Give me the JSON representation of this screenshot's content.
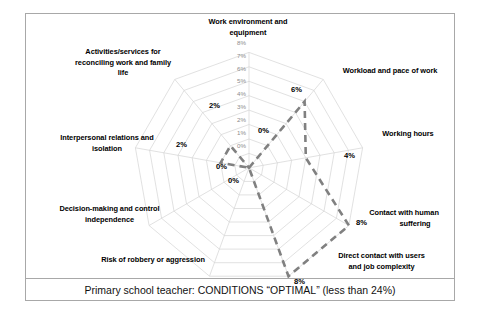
{
  "caption": {
    "text": "Primary school teacher: CONDITIONS “OPTIMAL” (less than 24%)"
  },
  "chart_data": {
    "type": "radar",
    "title": "",
    "subtitle": "",
    "xlabel": "",
    "ylabel": "",
    "grid": true,
    "legend": "none",
    "rlim": [
      0,
      8
    ],
    "rticks": [
      "0%",
      "1%",
      "2%",
      "3%",
      "4%",
      "5%",
      "6%",
      "7%",
      "8%"
    ],
    "rtick_values": [
      0,
      1,
      2,
      3,
      4,
      5,
      6,
      7,
      8
    ],
    "categories": [
      "Work environment and equipment",
      "Workload and pace of work",
      "Working hours",
      "Contact with human suffering",
      "Direct contact with users and job complexity",
      "Risk of robbery or aggression",
      "Decision-making and control independence",
      "Interpersonal relations and isolation",
      "Activities/services for reconciling work and family life"
    ],
    "series": [
      {
        "name": "Primary school teacher",
        "values": [
          0,
          6,
          4,
          8,
          8,
          0,
          0,
          2,
          2
        ],
        "value_labels": [
          "0%",
          "6%",
          "4%",
          "8%",
          "8%",
          "0%",
          "0%",
          "2%",
          "2%"
        ],
        "color": "#808080",
        "style": "dashed"
      }
    ]
  },
  "axis_labels": {
    "a0": "Work environment and\nequipment",
    "a1": "Workload and pace of work",
    "a2": "Working hours",
    "a3": "Contact with human\nsuffering",
    "a4": "Direct contact with users\nand job complexity",
    "a5": "Risk of robbery or aggression",
    "a6": "Decision-making and control\nindependence",
    "a7": "Interpersonal relations and\nisolation",
    "a8": "Activities/services for\nreconciling work and family\nlife"
  },
  "axis_labels_lines": {
    "a0": [
      "Work environment and",
      "equipment"
    ],
    "a1": [
      "Workload and pace of work"
    ],
    "a2": [
      "Working hours"
    ],
    "a3": [
      "Contact with human",
      "suffering"
    ],
    "a4": [
      "Direct contact with users",
      "and job complexity"
    ],
    "a5": [
      "Risk of robbery or aggression"
    ],
    "a6": [
      "Decision-making and control",
      "independence"
    ],
    "a7": [
      "Interpersonal relations and",
      "isolation"
    ],
    "a8": [
      "Activities/services for",
      "reconciling work and family",
      "life"
    ]
  },
  "value_labels": {
    "v0": "0%",
    "v1": "6%",
    "v2": "4%",
    "v3": "8%",
    "v4": "8%",
    "v5": "0%",
    "v6": "0%",
    "v7": "2%",
    "v8": "2%"
  },
  "ticks": {
    "t0": "0%",
    "t1": "1%",
    "t2": "2%",
    "t3": "3%",
    "t4": "4%",
    "t5": "5%",
    "t6": "6%",
    "t7": "7%",
    "t8": "8%"
  },
  "colors": {
    "series": "#808080",
    "grid": "#d4d4d4",
    "frame": "#a8a8a8",
    "text": "#000000",
    "tick_text": "#8c8c8c"
  }
}
